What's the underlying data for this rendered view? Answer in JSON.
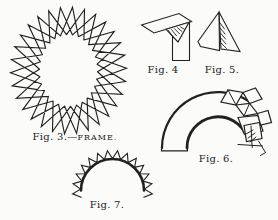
{
  "page": {
    "paper_color": "#fbfbf9",
    "ink_color": "#212121"
  },
  "figures": {
    "fig3": {
      "caption_prefix": "Fig. 3.—",
      "caption_name": "FRAME."
    },
    "fig4": {
      "caption": "Fig. 4"
    },
    "fig5": {
      "caption": "Fig. 5."
    },
    "fig6": {
      "caption": "Fig. 6."
    },
    "fig7": {
      "caption": "Fig. 7."
    }
  }
}
